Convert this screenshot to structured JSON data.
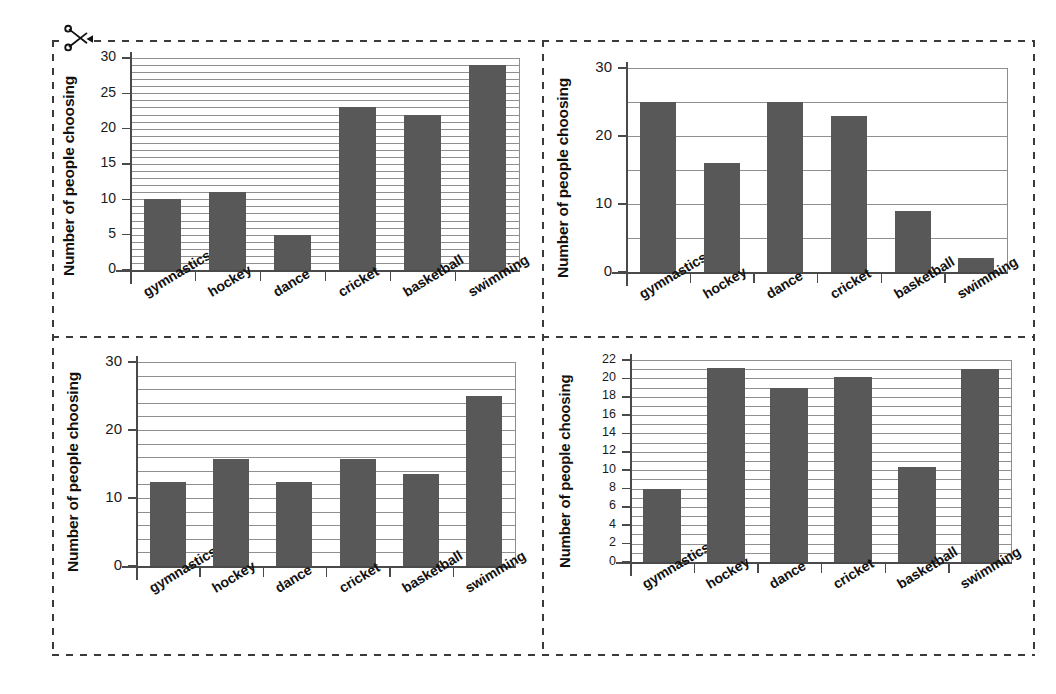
{
  "page": {
    "scissors_icon": "scissors-icon",
    "cut_line_style": "dashed"
  },
  "categories": [
    "gymnastics",
    "hockey",
    "dance",
    "cricket",
    "basketball",
    "swimming"
  ],
  "y_axis_label": "Number of people choosing",
  "bar_color": "#585858",
  "grid_color": "#8f8f8f",
  "axis_color": "#4a4a4a",
  "chart_data": [
    {
      "id": "chart-top-left",
      "type": "bar",
      "title": "",
      "xlabel": "",
      "ylabel": "Number of people choosing",
      "categories": [
        "gymnastics",
        "hockey",
        "dance",
        "cricket",
        "basketball",
        "swimming"
      ],
      "values": [
        10,
        11,
        5,
        23,
        22,
        29
      ],
      "ylim": [
        0,
        30
      ],
      "tick_labels": [
        "0",
        "5",
        "10",
        "15",
        "20",
        "25",
        "30"
      ],
      "tick_step": 5,
      "grid_step": 1,
      "grid": true,
      "legend": "none"
    },
    {
      "id": "chart-top-right",
      "type": "bar",
      "title": "",
      "xlabel": "",
      "ylabel": "Number of people choosing",
      "categories": [
        "gymnastics",
        "hockey",
        "dance",
        "cricket",
        "basketball",
        "swimming"
      ],
      "values": [
        25,
        16,
        25,
        23,
        9,
        2
      ],
      "values_in_draw_order": [
        25,
        16,
        25,
        9,
        23,
        2
      ],
      "ylim": [
        0,
        30
      ],
      "tick_labels": [
        "0",
        "10",
        "20",
        "30"
      ],
      "tick_step": 10,
      "grid_step": 5,
      "grid": true,
      "legend": "none"
    },
    {
      "id": "chart-bottom-left",
      "type": "bar",
      "title": "",
      "xlabel": "",
      "ylabel": "Number of people choosing",
      "categories": [
        "gymnastics",
        "hockey",
        "dance",
        "cricket",
        "basketball",
        "swimming"
      ],
      "values": [
        12.3,
        15.8,
        12.3,
        15.8,
        13.5,
        25
      ],
      "ylim": [
        0,
        30
      ],
      "tick_labels": [
        "0",
        "10",
        "20",
        "30"
      ],
      "tick_step": 10,
      "grid_step": 2,
      "grid": true,
      "legend": "none"
    },
    {
      "id": "chart-bottom-right",
      "type": "bar",
      "title": "",
      "xlabel": "",
      "ylabel": "Number of people choosing",
      "categories": [
        "gymnastics",
        "hockey",
        "dance",
        "cricket",
        "basketball",
        "swimming"
      ],
      "values": [
        7.9,
        21.1,
        19,
        20.1,
        10.3,
        21
      ],
      "ylim": [
        0,
        22
      ],
      "tick_labels": [
        "0",
        "2",
        "4",
        "6",
        "8",
        "10",
        "12",
        "14",
        "16",
        "18",
        "20",
        "22"
      ],
      "tick_step": 2,
      "grid_step": 1,
      "grid": true,
      "legend": "none"
    }
  ]
}
